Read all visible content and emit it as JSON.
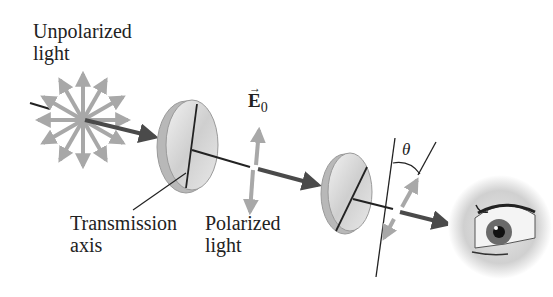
{
  "labels": {
    "unpolarized_line1": "Unpolarized",
    "unpolarized_line2": "light",
    "transmission_line1": "Transmission",
    "transmission_line2": "axis",
    "polarized_line1": "Polarized",
    "polarized_line2": "light",
    "efield_symbol": "E",
    "efield_subscript": "0",
    "angle_symbol": "θ"
  },
  "colors": {
    "beam": "#4a4a4a",
    "arrows_gray": "#a8a8a8",
    "line": "#222222",
    "disk_fill": "#d9d9d9",
    "disk_edge": "#9a9a9a"
  }
}
